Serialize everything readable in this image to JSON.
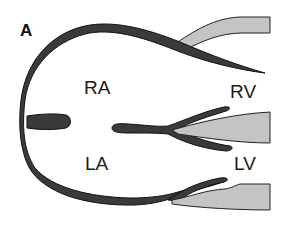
{
  "figure": {
    "panel_label": "A",
    "type": "cardiac anatomy schematic",
    "colors": {
      "wall": "#3a3a3a",
      "outline": "#111111",
      "valve_tissue": "#c4c4c4",
      "background": "#ffffff"
    }
  },
  "chambers": [
    {
      "id": "ra",
      "label": "RA",
      "x": 98,
      "y": 95
    },
    {
      "id": "rv",
      "label": "RV",
      "x": 245,
      "y": 98
    },
    {
      "id": "la",
      "label": "LA",
      "x": 97,
      "y": 168
    },
    {
      "id": "lv",
      "label": "LV",
      "x": 248,
      "y": 170
    }
  ],
  "structures": [
    "outer-atrial-wall",
    "interatrial-septum",
    "interventricular-septum",
    "tricuspid-valve-leaflet",
    "mitral-valve-leaflet",
    "upper-ventricular-wall",
    "lower-ventricular-wall"
  ]
}
